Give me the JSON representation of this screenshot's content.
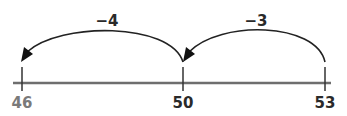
{
  "number_line": {
    "ticks": [
      {
        "value": "46",
        "x": 22,
        "color": "#7a7a7a"
      },
      {
        "value": "50",
        "x": 183,
        "color": "#2a2a2a"
      },
      {
        "value": "53",
        "x": 325,
        "color": "#2a2a2a"
      }
    ],
    "line_color": "#6e6e6e"
  },
  "jumps": [
    {
      "label": "−4",
      "from": "50",
      "to": "46"
    },
    {
      "label": "−3",
      "from": "53",
      "to": "50"
    }
  ]
}
